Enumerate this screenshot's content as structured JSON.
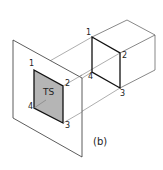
{
  "figure": {
    "caption": "(b)",
    "surface_label": "TS",
    "plane_points": {
      "p1": "1",
      "p2": "2",
      "p3": "3",
      "p4": "4"
    },
    "cube_points": {
      "p1": "1",
      "p2": "2",
      "p3": "3",
      "p4": "4"
    },
    "colors": {
      "line": "#222222",
      "shade": "#b5b5b5",
      "plane_fill": "#ffffff"
    }
  }
}
